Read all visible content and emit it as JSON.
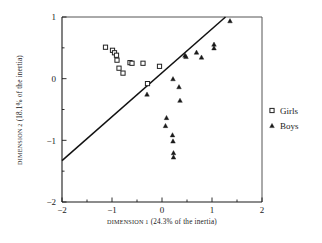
{
  "chart_data": {
    "type": "scatter",
    "title": "",
    "xlabel": "DIMENSION 1 (24.3% of the inertia)",
    "ylabel": "DIMENSION 2 (18.1% of the inertia)",
    "xlabel_small_caps": "DIMENSION 1",
    "xlabel_rest": " (24.3% of the inertia)",
    "ylabel_small_caps": "DIMENSION 2",
    "ylabel_rest": " (18.1% of the inertia)",
    "xlim": [
      -2,
      2
    ],
    "ylim": [
      -2,
      1
    ],
    "xticks": [
      -2,
      -1,
      0,
      1,
      2
    ],
    "xtick_labels": [
      "-2",
      "-1",
      "0",
      "1",
      "2"
    ],
    "yticks": [
      -2,
      -1,
      0,
      1
    ],
    "ytick_labels": [
      "-2",
      "-1",
      "0",
      "1"
    ],
    "xminor_ticks": [
      -1.5,
      -0.5,
      0.5,
      1.5
    ],
    "yminor_ticks": [
      -1.5,
      -0.5,
      0.5
    ],
    "grid": false,
    "legend_position": "right",
    "series": [
      {
        "name": "Girls",
        "marker": "square",
        "points": [
          [
            -1.13,
            0.51
          ],
          [
            -0.99,
            0.46
          ],
          [
            -0.95,
            0.42
          ],
          [
            -0.91,
            0.38
          ],
          [
            -0.9,
            0.3
          ],
          [
            -0.86,
            0.17
          ],
          [
            -0.78,
            0.09
          ],
          [
            -0.64,
            0.26
          ],
          [
            -0.6,
            0.25
          ],
          [
            -0.38,
            0.25
          ],
          [
            -0.29,
            -0.08
          ],
          [
            -0.05,
            0.2
          ]
        ]
      },
      {
        "name": "Boys",
        "marker": "triangle",
        "points": [
          [
            1.36,
            0.94
          ],
          [
            1.04,
            0.56
          ],
          [
            1.04,
            0.5
          ],
          [
            0.69,
            0.43
          ],
          [
            0.79,
            0.35
          ],
          [
            0.46,
            0.38
          ],
          [
            0.48,
            0.36
          ],
          [
            0.22,
            0.0
          ],
          [
            0.34,
            -0.13
          ],
          [
            0.36,
            -0.35
          ],
          [
            -0.3,
            -0.25
          ],
          [
            0.09,
            -0.63
          ],
          [
            0.07,
            -0.76
          ],
          [
            0.21,
            -0.91
          ],
          [
            0.22,
            -1.01
          ],
          [
            0.23,
            -1.2
          ],
          [
            0.23,
            -1.27
          ]
        ]
      }
    ],
    "trendline": {
      "x1": -2.0,
      "y1": -1.33,
      "x2": 1.27,
      "y2": 1.0
    }
  },
  "legend": {
    "items": [
      {
        "label": "Girls",
        "marker": "square"
      },
      {
        "label": "Boys",
        "marker": "triangle"
      }
    ]
  }
}
